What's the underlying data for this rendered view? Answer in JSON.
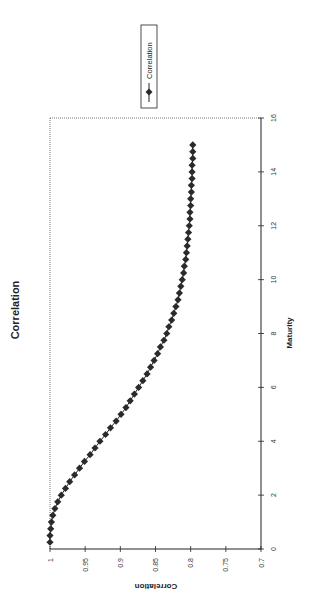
{
  "chart_data": {
    "type": "line",
    "title": "Correlation",
    "xlabel": "Maturity",
    "ylabel": "Correlation",
    "xlim": [
      0,
      16
    ],
    "ylim": [
      0.7,
      1
    ],
    "xticks": [
      0,
      2,
      4,
      6,
      8,
      10,
      12,
      14,
      16
    ],
    "yticks": [
      0.7,
      0.75,
      0.8,
      0.85,
      0.9,
      0.95,
      1
    ],
    "xtick_labels": [
      "0",
      "2",
      "4",
      "6",
      "8",
      "10",
      "12",
      "14",
      "16"
    ],
    "ytick_labels": [
      "0.7",
      "0.75",
      "0.8",
      "0.85",
      "0.9",
      "0.95",
      "1"
    ],
    "grid": false,
    "orientation": "rotated 90 degrees clockwise on page",
    "legend": {
      "position": "right",
      "entries": [
        "Correlation"
      ]
    },
    "marker": "diamond",
    "series": [
      {
        "name": "Correlation",
        "x": [
          0.25,
          0.5,
          0.75,
          1,
          1.25,
          1.5,
          1.75,
          2,
          2.25,
          2.5,
          2.75,
          3,
          3.25,
          3.5,
          3.75,
          4,
          4.25,
          4.5,
          4.75,
          5,
          5.25,
          5.5,
          5.75,
          6,
          6.25,
          6.5,
          6.75,
          7,
          7.25,
          7.5,
          7.75,
          8,
          8.25,
          8.5,
          8.75,
          9,
          9.25,
          9.5,
          9.75,
          10,
          10.25,
          10.5,
          10.75,
          11,
          11.25,
          11.5,
          11.75,
          12,
          12.25,
          12.5,
          12.75,
          13,
          13.25,
          13.5,
          13.75,
          14,
          14.25,
          14.5,
          14.75,
          15
        ],
        "values": [
          1.0,
          1.0,
          0.999,
          0.998,
          0.996,
          0.993,
          0.989,
          0.984,
          0.978,
          0.972,
          0.965,
          0.958,
          0.951,
          0.943,
          0.936,
          0.929,
          0.921,
          0.914,
          0.906,
          0.899,
          0.892,
          0.886,
          0.88,
          0.874,
          0.868,
          0.862,
          0.857,
          0.852,
          0.847,
          0.843,
          0.838,
          0.834,
          0.831,
          0.827,
          0.824,
          0.821,
          0.818,
          0.816,
          0.814,
          0.812,
          0.81,
          0.809,
          0.807,
          0.806,
          0.805,
          0.804,
          0.803,
          0.802,
          0.801,
          0.801,
          0.8,
          0.8,
          0.799,
          0.799,
          0.798,
          0.798,
          0.798,
          0.797,
          0.797,
          0.797
        ]
      }
    ]
  },
  "legend": {
    "label": "Correlation"
  }
}
